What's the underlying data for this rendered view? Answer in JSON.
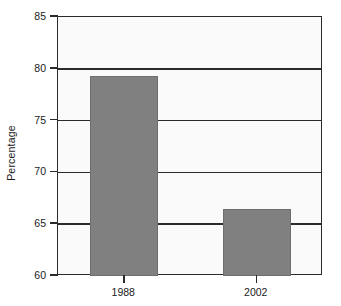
{
  "chart_data": {
    "type": "bar",
    "title": "",
    "xlabel": "",
    "ylabel": "Percentage",
    "categories": [
      "1988",
      "2002"
    ],
    "values": [
      79.3,
      66.5
    ],
    "ylim": [
      60,
      85
    ],
    "yticks": [
      60,
      65,
      70,
      75,
      80,
      85
    ],
    "ytick_labels": [
      "60",
      "65",
      "70",
      "75",
      "80",
      "85"
    ],
    "grid": true,
    "grid_axis": "y",
    "legend": false,
    "bar_color": "#808080",
    "plot_background": "#fafafa",
    "axis_color": "#2b2b2b",
    "figure_background": "#ffffff"
  }
}
